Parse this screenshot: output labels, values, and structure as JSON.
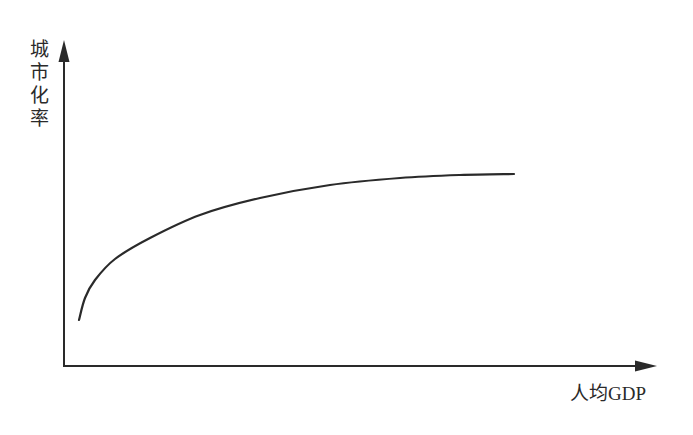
{
  "chart_data": {
    "type": "line",
    "title": "",
    "xlabel": "人均GDP",
    "ylabel": "城市化率",
    "ylabel_chars": [
      "城",
      "市",
      "化",
      "率"
    ],
    "grid": false,
    "legend": null,
    "x_ticks": [],
    "y_ticks": [],
    "series": [
      {
        "name": "城市化率曲线",
        "description": "concave increasing curve that rises steeply then levels off",
        "points_px": [
          [
            79,
            320
          ],
          [
            85,
            298
          ],
          [
            95,
            280
          ],
          [
            115,
            259
          ],
          [
            150,
            238
          ],
          [
            200,
            215
          ],
          [
            260,
            198
          ],
          [
            330,
            185
          ],
          [
            400,
            178
          ],
          [
            460,
            175
          ],
          [
            514,
            174
          ]
        ]
      }
    ],
    "colors": {
      "line": "#2a2a2a",
      "axis": "#2a2a2a",
      "background": "#ffffff"
    }
  }
}
